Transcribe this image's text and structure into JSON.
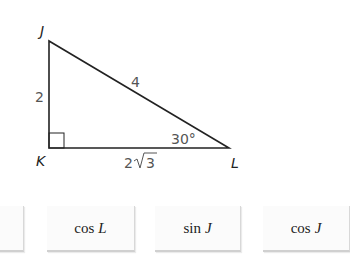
{
  "diagram": {
    "vertices": {
      "J": {
        "label": "J",
        "x": 49,
        "y": 41
      },
      "K": {
        "label": "K",
        "x": 49,
        "y": 148
      },
      "L": {
        "label": "L",
        "x": 229,
        "y": 148
      }
    },
    "sides": {
      "JK": "2",
      "JL": "4",
      "KL_coef": "2",
      "KL_radicand": "3"
    },
    "angle_L": "30°",
    "right_angle_at": "K",
    "line_color": "#222222"
  },
  "tiles": [
    {
      "func": "",
      "var": ""
    },
    {
      "func": "cos",
      "var": "L"
    },
    {
      "func": "sin",
      "var": "J"
    },
    {
      "func": "cos",
      "var": "J"
    }
  ]
}
